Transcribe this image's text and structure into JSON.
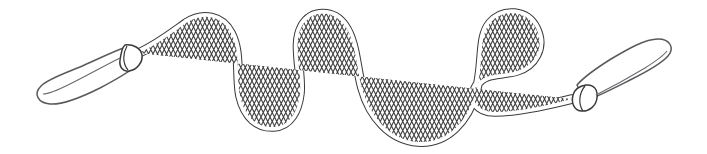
{
  "image": {
    "kind": "line-art-illustration",
    "subject": "jump rope",
    "title": "Braided jump rope with paddle handles",
    "alt_text": "Black and white line drawing of a skipping rope laid out in a wavy serpentine S-curve with a teardrop-shaped handle at each end",
    "background_color": "#ffffff",
    "stroke_color": "#3a3a3c",
    "handle_stroke_color": "#5a5a5e",
    "fill_color": "#ffffff",
    "width": 707,
    "height": 154
  },
  "parts": [
    {
      "id": "left-handle",
      "label": "Left handle",
      "shape": "teardrop paddle grip",
      "tip_x": 38,
      "tip_y": 90,
      "collar_x": 132,
      "collar_y": 56,
      "angle_degrees": -22
    },
    {
      "id": "left-collar",
      "label": "Left ferrule collar",
      "shape": "cone",
      "x": 132,
      "y": 56
    },
    {
      "id": "rope",
      "label": "Braided rope",
      "texture": "crosshatch braid",
      "thickness": 8,
      "start_x": 139,
      "start_y": 53,
      "end_x": 576,
      "end_y": 99
    },
    {
      "id": "right-collar",
      "label": "Right ferrule collar",
      "shape": "cone",
      "x": 580,
      "y": 99
    },
    {
      "id": "right-handle",
      "label": "Right handle",
      "shape": "teardrop paddle grip",
      "collar_x": 580,
      "collar_y": 99,
      "tip_x": 668,
      "tip_y": 52,
      "angle_degrees": -26
    }
  ],
  "rope_path": {
    "description": "Serpentine path: rises from left handle to a first crest, dips into a trough, climbs to a high crest, plunges to the deepest valley, rises to the highest crest, then hooks back down to the right handle.",
    "crests": [
      {
        "name": "crest-1",
        "x": 188,
        "y": 22
      },
      {
        "name": "crest-2",
        "x": 300,
        "y": 13
      },
      {
        "name": "crest-3",
        "x": 512,
        "y": 14
      }
    ],
    "troughs": [
      {
        "name": "trough-1",
        "x": 265,
        "y": 126
      },
      {
        "name": "trough-2",
        "x": 424,
        "y": 142
      }
    ],
    "d": "M 139,53 C 158,44 172,33 186,23 C 203,12 222,16 231,33 C 241,52 236,76 240,96 C 245,118 258,128 274,127 C 290,126 298,111 300,93 C 302,70 292,44 302,26 C 312,9 334,10 345,26 C 356,42 356,66 362,88 C 370,117 390,140 418,142 C 448,144 468,120 476,92 C 484,64 478,37 490,23 C 503,8 527,10 536,28 C 546,48 534,66 517,71 C 500,76 485,72 477,85 C 468,99 477,112 495,112 C 519,112 548,105 572,99"
  },
  "accessibility": {
    "role": "img",
    "description": "Illustration of a jump rope"
  }
}
